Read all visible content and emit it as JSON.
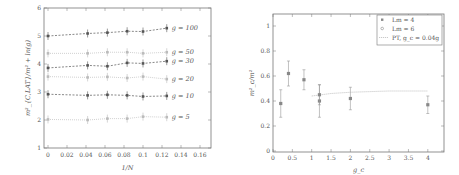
{
  "chart_data": [
    {
      "type": "line",
      "title": "",
      "xlabel": "1/N",
      "ylabel": "m²_{C,LAT}/m² + ln(g)",
      "xlim": [
        -0.003,
        0.172
      ],
      "ylim": [
        1,
        6
      ],
      "xticks": [
        "0",
        "0.02",
        "0.04",
        "0.06",
        "0.08",
        "0.1",
        "0.12",
        "0.14",
        "0.16"
      ],
      "yticks": [
        "1",
        "2",
        "3",
        "4",
        "5",
        "6"
      ],
      "grid": false,
      "x": [
        0,
        0.0417,
        0.0625,
        0.0833,
        0.1,
        0.125
      ],
      "series": [
        {
          "name": "g = 100",
          "style": "dark-dashed",
          "values": [
            5.0,
            5.09,
            5.12,
            5.17,
            5.16,
            5.28
          ]
        },
        {
          "name": "g = 50",
          "style": "light-dotted",
          "values": [
            4.38,
            4.38,
            4.42,
            4.42,
            4.38,
            4.42
          ]
        },
        {
          "name": "g = 30",
          "style": "dark-dashed",
          "values": [
            3.86,
            3.95,
            3.92,
            4.04,
            4.02,
            4.1
          ]
        },
        {
          "name": "g = 20",
          "style": "light-dotted",
          "values": [
            3.55,
            3.52,
            3.54,
            3.5,
            3.55,
            3.46
          ]
        },
        {
          "name": "g = 10",
          "style": "dark-dashed",
          "values": [
            2.92,
            2.88,
            2.9,
            2.88,
            2.84,
            2.86
          ]
        },
        {
          "name": "g = 5",
          "style": "light-dotted",
          "values": [
            2.02,
            2.0,
            2.05,
            2.05,
            2.12,
            2.1
          ]
        }
      ]
    },
    {
      "type": "scatter",
      "title": "",
      "xlabel": "g_c",
      "ylabel": "m²_c/m²",
      "xlim": [
        0,
        4.5
      ],
      "ylim": [
        0,
        1.1
      ],
      "xticks": [
        "0",
        "0.5",
        "1",
        "1.5",
        "2",
        "2.5",
        "3",
        "3.5",
        "4"
      ],
      "yticks": [
        "0",
        "0.2",
        "0.4",
        "0.6",
        "0.8",
        "1"
      ],
      "grid": false,
      "legend_position": "upper right",
      "series": [
        {
          "name": "Lm = 4",
          "marker": "filled-square",
          "x": [
            0.2,
            0.4,
            0.8,
            1.2,
            1.2,
            2.0,
            4.0
          ],
          "values": [
            0.38,
            0.62,
            0.57,
            0.4,
            0.45,
            0.42,
            0.37
          ],
          "errors": [
            0.11,
            0.1,
            0.08,
            0.13,
            0.08,
            0.09,
            0.07
          ]
        },
        {
          "name": "Lm = 6",
          "marker": "open-circle",
          "x": [],
          "values": []
        },
        {
          "name": "PT, g_c = 0.04g",
          "style": "dotted-line",
          "x": [
            1.0,
            1.5,
            2.0,
            2.5,
            3.0,
            3.5,
            4.0
          ],
          "values": [
            0.44,
            0.46,
            0.47,
            0.475,
            0.48,
            0.48,
            0.48
          ]
        }
      ]
    }
  ],
  "left_chart": {
    "xlabel": "1/N",
    "ylabel": "m²_{C,LAT}/m² + ln(g)",
    "curve_labels": [
      "g = 100",
      "g = 50",
      "g = 30",
      "g = 20",
      "g = 10",
      "g = 5"
    ]
  },
  "right_chart": {
    "xlabel": "g_c",
    "ylabel": "m²_c/m²",
    "legend": [
      "Lm = 4",
      "Lm = 6",
      "PT, g_c = 0.04g"
    ]
  }
}
